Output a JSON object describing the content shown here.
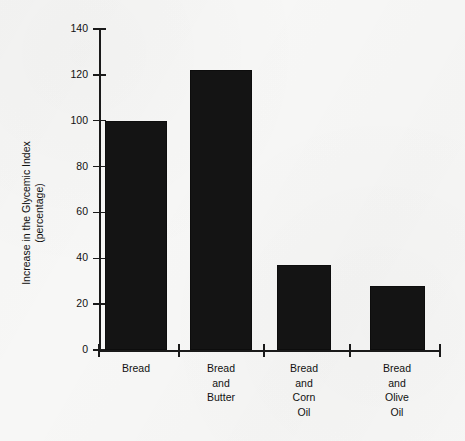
{
  "chart_data": {
    "type": "bar",
    "title": "",
    "xlabel": "",
    "ylabel": "Increase in the Glycemic Index (percentage)",
    "ylabel_line1": "Increase in the Glycemic Index",
    "ylabel_line2": "(percentage)",
    "categories": [
      "Bread",
      "Bread\nand\nButter",
      "Bread\nand\nCorn\nOil",
      "Bread\nand\nOlive\nOil"
    ],
    "values": [
      100,
      122,
      37,
      28
    ],
    "ylim": [
      0,
      140
    ],
    "yticks": [
      0,
      20,
      40,
      60,
      80,
      100,
      120,
      140
    ],
    "ytick_labels": [
      "0",
      "20",
      "40",
      "60",
      "80",
      "100",
      "120",
      "140"
    ],
    "grid": false,
    "legend": "none",
    "bar_color": "#141414",
    "background_color": "#f7f7f6",
    "axis_color": "#1a1a1a"
  },
  "axis": {
    "y_title_line1": "Increase in the Glycemic Index",
    "y_title_line2": "(percentage)"
  }
}
